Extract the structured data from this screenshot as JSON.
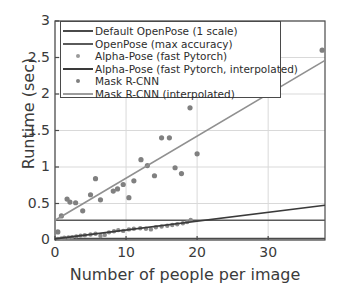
{
  "chart_data": {
    "type": "scatter",
    "title": "",
    "xlabel": "Number of people per image",
    "ylabel": "Runtime (sec)",
    "xlim": [
      0,
      38
    ],
    "ylim": [
      0,
      3
    ],
    "xticks": [
      0,
      10,
      20,
      30
    ],
    "yticks": [
      0,
      0.5,
      1,
      1.5,
      2,
      2.5,
      3
    ],
    "xtick_labels": [
      "0",
      "10",
      "20",
      "30"
    ],
    "ytick_labels": [
      "0",
      "0.5",
      "1",
      "1.5",
      "2",
      "2.5",
      "3"
    ],
    "grid": true,
    "legend_position": "upper left",
    "colors": {
      "default_openpose": "#4a4a4a",
      "openpose_max": "#5a5a5a",
      "alphapose_points": "#8c8c8c",
      "alphapose_fit": "#3a3a3a",
      "maskrcnn_points": "#808080",
      "maskrcnn_fit": "#909090",
      "axis": "#4a4a4a",
      "grid": "#d9d9d9",
      "text": "#3b3b3b"
    },
    "series": [
      {
        "name": "Default OpenPose (1 scale)",
        "kind": "hline",
        "marker": "line",
        "y": 0.02
      },
      {
        "name": "OpenPose (max accuracy)",
        "kind": "hline",
        "marker": "line",
        "y": 0.27
      },
      {
        "name": "Alpha-Pose (fast Pytorch)",
        "kind": "scatter",
        "marker": "dot",
        "points": [
          [
            0.4,
            0.015
          ],
          [
            0.9,
            0.02
          ],
          [
            1.3,
            0.03
          ],
          [
            1.9,
            0.035
          ],
          [
            2.4,
            0.04
          ],
          [
            3.0,
            0.05
          ],
          [
            3.6,
            0.06
          ],
          [
            4.2,
            0.065
          ],
          [
            5.0,
            0.075
          ],
          [
            5.7,
            0.085
          ],
          [
            6.4,
            0.055
          ],
          [
            7.0,
            0.07
          ],
          [
            7.6,
            0.105
          ],
          [
            8.3,
            0.12
          ],
          [
            8.9,
            0.135
          ],
          [
            9.6,
            0.125
          ],
          [
            10.4,
            0.145
          ],
          [
            11.1,
            0.155
          ],
          [
            12.0,
            0.16
          ],
          [
            12.8,
            0.155
          ],
          [
            13.5,
            0.145
          ],
          [
            14.2,
            0.175
          ],
          [
            15.0,
            0.185
          ],
          [
            15.8,
            0.195
          ],
          [
            16.5,
            0.205
          ],
          [
            17.2,
            0.215
          ],
          [
            18.0,
            0.23
          ],
          [
            18.6,
            0.245
          ],
          [
            19.1,
            0.275
          ]
        ]
      },
      {
        "name": "Alpha-Pose (fast Pytorch, interpolated)",
        "kind": "line",
        "marker": "line",
        "fit": [
          [
            0,
            0.015
          ],
          [
            38,
            0.475
          ]
        ]
      },
      {
        "name": "Mask R-CNN",
        "kind": "scatter",
        "marker": "dot",
        "points": [
          [
            0.4,
            0.11
          ],
          [
            0.9,
            0.33
          ],
          [
            1.7,
            0.56
          ],
          [
            2.1,
            0.52
          ],
          [
            2.9,
            0.51
          ],
          [
            3.9,
            0.4
          ],
          [
            5.0,
            0.62
          ],
          [
            5.7,
            0.84
          ],
          [
            6.4,
            0.55
          ],
          [
            8.2,
            0.67
          ],
          [
            8.8,
            0.7
          ],
          [
            9.6,
            0.76
          ],
          [
            10.4,
            0.58
          ],
          [
            11.1,
            0.81
          ],
          [
            12.1,
            1.1
          ],
          [
            13.0,
            1.02
          ],
          [
            14.0,
            0.88
          ],
          [
            15.0,
            1.4
          ],
          [
            16.1,
            1.4
          ],
          [
            16.9,
            0.99
          ],
          [
            17.8,
            0.91
          ],
          [
            19.0,
            1.81
          ],
          [
            20.0,
            1.18
          ],
          [
            37.6,
            2.6
          ]
        ]
      },
      {
        "name": "Mask R-CNN (interpolated)",
        "kind": "line",
        "marker": "line",
        "fit": [
          [
            0,
            0.27
          ],
          [
            38,
            2.46
          ]
        ]
      }
    ]
  },
  "axes": {
    "xlabel": "Number of people per image",
    "ylabel": "Runtime (sec)",
    "xtick_labels": [
      "0",
      "10",
      "20",
      "30"
    ],
    "ytick_labels": [
      "0",
      "0.5",
      "1",
      "1.5",
      "2",
      "2.5",
      "3"
    ]
  },
  "legend": {
    "items": [
      {
        "label": "Default OpenPose (1 scale)",
        "marker": "line",
        "color": "#4a4a4a"
      },
      {
        "label": "OpenPose (max accuracy)",
        "marker": "line",
        "color": "#5a5a5a"
      },
      {
        "label": "Alpha-Pose (fast Pytorch)",
        "marker": "dot",
        "color": "#9a9a9a"
      },
      {
        "label": "Alpha-Pose (fast Pytorch, interpolated)",
        "marker": "line",
        "color": "#3a3a3a"
      },
      {
        "label": "Mask R-CNN",
        "marker": "dot",
        "color": "#808080"
      },
      {
        "label": "Mask R-CNN (interpolated)",
        "marker": "line",
        "color": "#9c9c9c"
      }
    ]
  }
}
